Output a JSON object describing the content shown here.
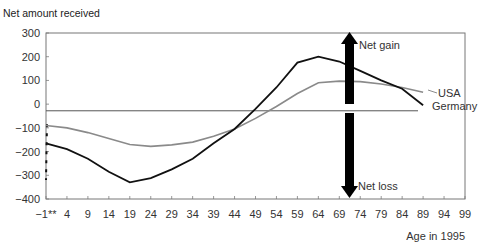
{
  "chart_data": {
    "type": "line",
    "title": "Net amount received",
    "xlabel": "Age in 1995",
    "ylabel": "Net amount received",
    "ylim": [
      -400,
      300
    ],
    "xlim": [
      -1,
      99
    ],
    "grid": false,
    "legend_position": "inline-right",
    "y_ticks": [
      300,
      200,
      100,
      0,
      -100,
      -200,
      -300,
      -400
    ],
    "x_ticks": [
      "-1**",
      "4",
      "9",
      "14",
      "19",
      "24",
      "29",
      "34",
      "39",
      "44",
      "49",
      "54",
      "59",
      "64",
      "69",
      "74",
      "79",
      "84",
      "89",
      "94",
      "99"
    ],
    "x": [
      -1,
      4,
      9,
      14,
      19,
      24,
      29,
      34,
      39,
      44,
      49,
      54,
      59,
      64,
      69,
      74,
      79,
      84,
      89
    ],
    "series": [
      {
        "name": "USA",
        "color": "#8a8a8a",
        "values": [
          -90,
          -100,
          -120,
          -145,
          -170,
          -178,
          -172,
          -160,
          -135,
          -105,
          -60,
          -10,
          45,
          90,
          97,
          95,
          85,
          70,
          50
        ]
      },
      {
        "name": "Germany",
        "color": "#111111",
        "values": [
          -165,
          -190,
          -230,
          -285,
          -330,
          -312,
          -275,
          -230,
          -165,
          -105,
          -20,
          70,
          175,
          200,
          180,
          140,
          100,
          65,
          -5
        ]
      }
    ],
    "reference_line": {
      "value": -28,
      "color": "#555555"
    },
    "annotations": [
      {
        "text": "Net gain",
        "type": "arrow-up",
        "x": 71
      },
      {
        "text": "Net loss",
        "type": "arrow-down",
        "x": 71
      },
      {
        "text": "USA",
        "type": "series-label"
      },
      {
        "text": "Germany",
        "type": "series-label"
      }
    ],
    "dashed_segment": {
      "x": -1,
      "from": -85,
      "to": -320
    }
  }
}
